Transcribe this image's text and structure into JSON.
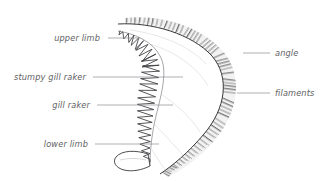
{
  "figure": {
    "background_color": "#ffffff",
    "label_color": "#5e5e62",
    "leader_color": "#8d8d92",
    "ink_color": "#3a3a3d"
  },
  "labels": [
    {
      "id": "upper-limb",
      "text": "upper limb",
      "side": "left",
      "text_x": 100,
      "text_y": 38,
      "leader_x1": 108,
      "leader_y1": 38,
      "leader_x2": 140,
      "leader_y2": 38
    },
    {
      "id": "stumpy-gill-raker",
      "text": "stumpy gill raker",
      "side": "left",
      "text_x": 86,
      "text_y": 77,
      "leader_x1": 93,
      "leader_y1": 77,
      "leader_x2": 183,
      "leader_y2": 77
    },
    {
      "id": "gill-raker",
      "text": "gill raker",
      "side": "left",
      "text_x": 90,
      "text_y": 105,
      "leader_x1": 97,
      "leader_y1": 105,
      "leader_x2": 173,
      "leader_y2": 105
    },
    {
      "id": "lower-limb",
      "text": "lower limb",
      "side": "left",
      "text_x": 88,
      "text_y": 144,
      "leader_x1": 95,
      "leader_y1": 144,
      "leader_x2": 159,
      "leader_y2": 144
    },
    {
      "id": "angle",
      "text": "angle",
      "side": "right",
      "text_x": 275,
      "text_y": 53,
      "leader_x1": 243,
      "leader_y1": 53,
      "leader_x2": 270,
      "leader_y2": 53
    },
    {
      "id": "filaments",
      "text": "filaments",
      "side": "right",
      "text_x": 275,
      "text_y": 93,
      "leader_x1": 237,
      "leader_y1": 93,
      "leader_x2": 270,
      "leader_y2": 93
    }
  ],
  "structures": {
    "arch_name": "gill arch",
    "filament_count": 64,
    "raker_count": 26
  }
}
